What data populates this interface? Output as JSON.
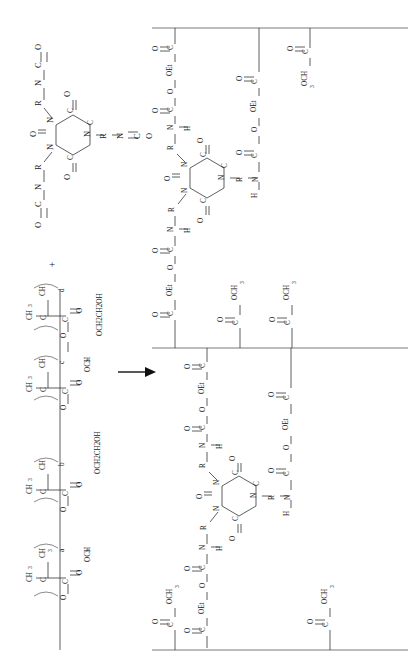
{
  "figure": {
    "orientation": "rotated-90",
    "background_color": "#ffffff",
    "line_color": "#2a2a2a"
  },
  "reaction": {
    "plus_sign": "+",
    "arrow": "→",
    "arrow_name": "reaction-arrow"
  },
  "reactant_crosslinker": {
    "name": "isocyanurate-triisocyanate",
    "ring_label": "isocyanurate-ring",
    "ring_atoms": [
      "N",
      "C",
      "N",
      "C",
      "N",
      "C"
    ],
    "ring_carbonyl_label": "O",
    "arms": [
      {
        "id": "arm-1",
        "atoms": [
          "R",
          "N",
          "C",
          "O"
        ],
        "linkage": "N=C=O"
      },
      {
        "id": "arm-2",
        "atoms": [
          "R",
          "N",
          "C",
          "O"
        ],
        "linkage": "N=C=O"
      },
      {
        "id": "arm-3",
        "atoms": [
          "R",
          "N",
          "C",
          "O"
        ],
        "linkage": "N=C=O"
      }
    ],
    "labels": {
      "R": "R",
      "N": "N",
      "C": "C",
      "O": "O"
    }
  },
  "reactant_polymer": {
    "name": "acrylic-copolymer",
    "bracket_glyph": "(",
    "backbone_atoms": {
      "ch2": "CH",
      "ch2_sub": "2",
      "quaternary": "C"
    },
    "units": [
      {
        "id": "unit-a",
        "subscript": "a",
        "methyl": "CH",
        "methyl_sub": "3",
        "carbonyl": "O",
        "ester_carbon": "C",
        "ester_oxygen": "O",
        "pendant": "OCH",
        "pendant_sub": "3",
        "pendant_full": "OCH3",
        "monomer": "methyl methacrylate"
      },
      {
        "id": "unit-b",
        "subscript": "b",
        "methyl": "CH",
        "methyl_sub": "3",
        "carbonyl": "O",
        "ester_carbon": "C",
        "ester_oxygen": "O",
        "pendant": "OCH2CH2OH",
        "pendant_sub": "",
        "pendant_full": "OCH2CH2OH",
        "monomer": "hydroxyethyl methacrylate"
      },
      {
        "id": "unit-c",
        "subscript": "c",
        "methyl": "CH",
        "methyl_sub": "3",
        "carbonyl": "O",
        "ester_carbon": "C",
        "ester_oxygen": "O",
        "pendant": "OCH",
        "pendant_sub": "3",
        "pendant_full": "OCH3",
        "monomer": "methyl methacrylate"
      },
      {
        "id": "unit-d",
        "subscript": "d",
        "methyl": "CH",
        "methyl_sub": "3",
        "carbonyl": "O",
        "ester_carbon": "C",
        "ester_oxygen": "O",
        "pendant": "OCH2CH2OH",
        "pendant_sub": "",
        "pendant_full": "OCH2CH2OH",
        "monomer": "hydroxyethyl methacrylate"
      }
    ]
  },
  "product": {
    "name": "crosslinked-urethane-network",
    "panels": [
      {
        "id": "product-panel-top",
        "chain_label": "polymer-backbone-top"
      },
      {
        "id": "product-panel-bottom",
        "chain_label": "polymer-backbone-bottom"
      }
    ],
    "urethane_link": {
      "atoms": [
        "C",
        "O",
        "OEt",
        "O",
        "C",
        "N",
        "H",
        "R"
      ],
      "carbonyl": "O",
      "nitrogen": "N",
      "hydrogen": "H",
      "spacer": "R",
      "et_label": "OEt"
    },
    "pendant_labels": {
      "methyl_ester": "OCH",
      "methyl_ester_sub": "3",
      "methyl_ester_full": "OCH3",
      "et_ester": "OEt"
    },
    "ring_atoms": [
      "N",
      "C",
      "N",
      "C",
      "N",
      "C"
    ],
    "ring_carbonyl": "O",
    "top_pendants": [
      "OEt",
      "backbone",
      "OCH3"
    ],
    "mid_pendants": [
      "OEt",
      "OCH3",
      "OCH3"
    ],
    "bottom_pendants": [
      "OCH3",
      "OEt",
      "OCH3"
    ]
  }
}
